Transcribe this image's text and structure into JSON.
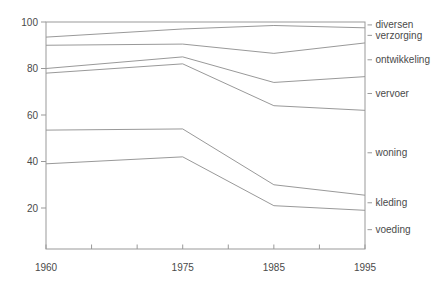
{
  "colors": {
    "background": "#ffffff",
    "line": "#999999",
    "frame": "#999999",
    "tick": "#999999",
    "text": "#4a4a4a"
  },
  "chart_data": {
    "type": "line",
    "subtype": "cumulative-share-boundaries",
    "title": "",
    "xlabel": "",
    "ylabel": "",
    "x": [
      1960,
      1975,
      1985,
      1995
    ],
    "x_axis_ticks": [
      1960,
      1965,
      1970,
      1975,
      1980,
      1985,
      1990,
      1995
    ],
    "x_tick_labels": [
      "1960",
      "1975",
      "1985",
      "1995"
    ],
    "y_ticks": [
      20,
      40,
      60,
      80,
      100
    ],
    "y_tick_labels": [
      "20",
      "40",
      "60",
      "80",
      "100"
    ],
    "xlim": [
      1960,
      1995
    ],
    "ylim": [
      0,
      100
    ],
    "grid": false,
    "legend_position": "right-margin",
    "series": [
      {
        "name": "voeding",
        "cumulative_top": [
          39,
          42,
          21,
          19
        ],
        "share": [
          39,
          42,
          21,
          19
        ]
      },
      {
        "name": "kleding",
        "cumulative_top": [
          53.5,
          54,
          30,
          25.5
        ],
        "share": [
          14.5,
          12,
          9,
          6.5
        ]
      },
      {
        "name": "woning",
        "cumulative_top": [
          78,
          82,
          64,
          62
        ],
        "share": [
          24.5,
          28,
          34,
          36.5
        ]
      },
      {
        "name": "vervoer",
        "cumulative_top": [
          80,
          85,
          74,
          76.5
        ],
        "share": [
          2,
          3,
          10,
          14.5
        ]
      },
      {
        "name": "ontwikkeling",
        "cumulative_top": [
          90,
          90.5,
          86.5,
          91
        ],
        "share": [
          10,
          5.5,
          12.5,
          14.5
        ]
      },
      {
        "name": "verzorging",
        "cumulative_top": [
          93.5,
          97,
          98.5,
          97.5
        ],
        "share": [
          3.5,
          6.5,
          12,
          6.5
        ]
      },
      {
        "name": "diversen",
        "cumulative_top": [
          100,
          100,
          100,
          100
        ],
        "share": [
          6.5,
          3,
          1.5,
          2.5
        ]
      }
    ],
    "right_labels": [
      "diversen",
      "verzorging",
      "ontwikkeling",
      "vervoer",
      "woning",
      "kleding",
      "voeding"
    ]
  }
}
